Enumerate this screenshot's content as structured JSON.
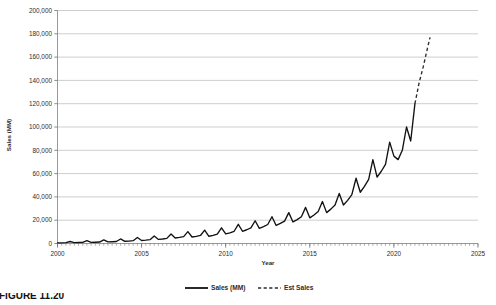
{
  "caption": {
    "text": "FIGURE 11.20"
  },
  "chart_data": {
    "type": "line",
    "title": "",
    "xlabel": "Year",
    "ylabel": "Sales (MM)",
    "xlim": [
      2000,
      2025
    ],
    "ylim": [
      0,
      200000
    ],
    "grid": true,
    "legend_position": "bottom",
    "y_ticks": [
      0,
      20000,
      40000,
      60000,
      80000,
      100000,
      120000,
      140000,
      160000,
      180000,
      200000
    ],
    "y_tick_labels": [
      "0",
      "20,000",
      "40,000",
      "60,000",
      "80,000",
      "100,000",
      "120,000",
      "140,000",
      "160,000",
      "180,000",
      "200,000"
    ],
    "x_ticks": [
      2000,
      2005,
      2010,
      2015,
      2020,
      2025
    ],
    "x_tick_labels": [
      "2000",
      "2005",
      "2010",
      "2015",
      "2020",
      "2025"
    ],
    "x_minor_tick_interval": 0.25,
    "series": [
      {
        "name": "Sales (MM)",
        "style": "solid",
        "color": "#121212",
        "x": [
          2000.0,
          2000.25,
          2000.5,
          2000.75,
          2001.0,
          2001.25,
          2001.5,
          2001.75,
          2002.0,
          2002.25,
          2002.5,
          2002.75,
          2003.0,
          2003.25,
          2003.5,
          2003.75,
          2004.0,
          2004.25,
          2004.5,
          2004.75,
          2005.0,
          2005.25,
          2005.5,
          2005.75,
          2006.0,
          2006.25,
          2006.5,
          2006.75,
          2007.0,
          2007.25,
          2007.5,
          2007.75,
          2008.0,
          2008.25,
          2008.5,
          2008.75,
          2009.0,
          2009.25,
          2009.5,
          2009.75,
          2010.0,
          2010.25,
          2010.5,
          2010.75,
          2011.0,
          2011.25,
          2011.5,
          2011.75,
          2012.0,
          2012.25,
          2012.5,
          2012.75,
          2013.0,
          2013.25,
          2013.5,
          2013.75,
          2014.0,
          2014.25,
          2014.5,
          2014.75,
          2015.0,
          2015.25,
          2015.5,
          2015.75,
          2016.0,
          2016.25,
          2016.5,
          2016.75,
          2017.0,
          2017.25,
          2017.5,
          2017.75,
          2018.0,
          2018.25,
          2018.5,
          2018.75,
          2019.0,
          2019.25,
          2019.5,
          2019.75,
          2020.0,
          2020.25,
          2020.5,
          2020.75,
          2021.0,
          2021.25
        ],
        "values": [
          560,
          600,
          700,
          1700,
          750,
          820,
          900,
          2400,
          1000,
          1100,
          1250,
          3100,
          1350,
          1500,
          1700,
          3900,
          1900,
          2100,
          2400,
          5200,
          2600,
          2900,
          3300,
          6400,
          3500,
          3900,
          4400,
          8200,
          4700,
          5200,
          5900,
          10200,
          5600,
          6100,
          6900,
          11500,
          6200,
          7000,
          8000,
          13500,
          8200,
          9200,
          10500,
          16500,
          10500,
          11800,
          13400,
          19500,
          13000,
          14500,
          16300,
          23000,
          15500,
          17200,
          19200,
          26500,
          18500,
          20500,
          23000,
          31000,
          22000,
          24500,
          27500,
          36000,
          26500,
          29500,
          33000,
          43000,
          33000,
          37000,
          42000,
          56000,
          44000,
          49000,
          55000,
          72000,
          57000,
          62000,
          68000,
          87000,
          75000,
          72000,
          80000,
          100000,
          88000,
          120000
        ]
      },
      {
        "name": "Est Sales",
        "style": "dashed",
        "color": "#2a2a2a",
        "x": [
          2021.25,
          2021.5,
          2021.75,
          2022.0,
          2022.15
        ],
        "values": [
          120000,
          138000,
          152000,
          168000,
          177000
        ]
      }
    ]
  },
  "legend": {
    "items": [
      {
        "label": "Sales (MM)",
        "style": "solid"
      },
      {
        "label": "Est Sales",
        "style": "dashed"
      }
    ]
  }
}
